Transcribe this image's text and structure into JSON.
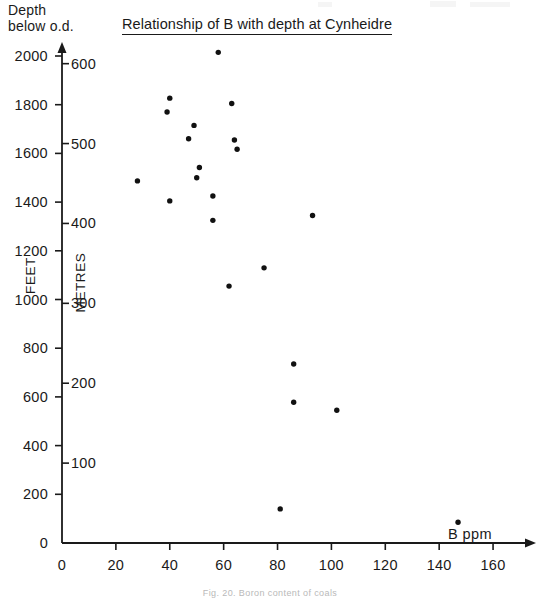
{
  "figure": {
    "axis_header": "Depth\nbelow o.d.",
    "caption": "Fig. 20.  Boron content of coals"
  },
  "chart_data": {
    "type": "scatter",
    "title": "Relationship of B with depth at Cynheidre",
    "xlabel": "B ppm",
    "ylabel": "FEET",
    "ylabel_secondary": "METRES",
    "xlim": [
      0,
      170
    ],
    "ylim": [
      0,
      2060
    ],
    "ylim_secondary": [
      0,
      628
    ],
    "grid": false,
    "legend": null,
    "xticks": [
      0,
      20,
      40,
      60,
      80,
      100,
      120,
      140,
      160
    ],
    "xtick_labels": [
      "0",
      "20",
      "40",
      "60",
      "80",
      "100",
      "120",
      "140",
      "160"
    ],
    "yticks": [
      0,
      200,
      400,
      600,
      800,
      1000,
      1200,
      1400,
      1600,
      1800,
      2000
    ],
    "ytick_labels": [
      "0",
      "200",
      "400",
      "600",
      "800",
      "1000",
      "1200",
      "1400",
      "1600",
      "1800",
      "2000"
    ],
    "yticks_secondary": [
      100,
      200,
      300,
      400,
      500,
      600
    ],
    "ytick_labels_secondary": [
      "100",
      "200",
      "300",
      "400",
      "500",
      "600"
    ],
    "point_color": "#111111",
    "axis_color": "#1a1a1a",
    "points": [
      {
        "x": 58,
        "y": 2015
      },
      {
        "x": 40,
        "y": 1827
      },
      {
        "x": 39,
        "y": 1770
      },
      {
        "x": 63,
        "y": 1805
      },
      {
        "x": 49,
        "y": 1715
      },
      {
        "x": 47,
        "y": 1660
      },
      {
        "x": 64,
        "y": 1655
      },
      {
        "x": 65,
        "y": 1617
      },
      {
        "x": 51,
        "y": 1542
      },
      {
        "x": 50,
        "y": 1500
      },
      {
        "x": 28,
        "y": 1487
      },
      {
        "x": 56,
        "y": 1425
      },
      {
        "x": 40,
        "y": 1405
      },
      {
        "x": 56,
        "y": 1325
      },
      {
        "x": 93,
        "y": 1345
      },
      {
        "x": 75,
        "y": 1130
      },
      {
        "x": 62,
        "y": 1055
      },
      {
        "x": 86,
        "y": 735
      },
      {
        "x": 86,
        "y": 578
      },
      {
        "x": 102,
        "y": 545
      },
      {
        "x": 81,
        "y": 140
      },
      {
        "x": 147,
        "y": 85
      }
    ]
  }
}
